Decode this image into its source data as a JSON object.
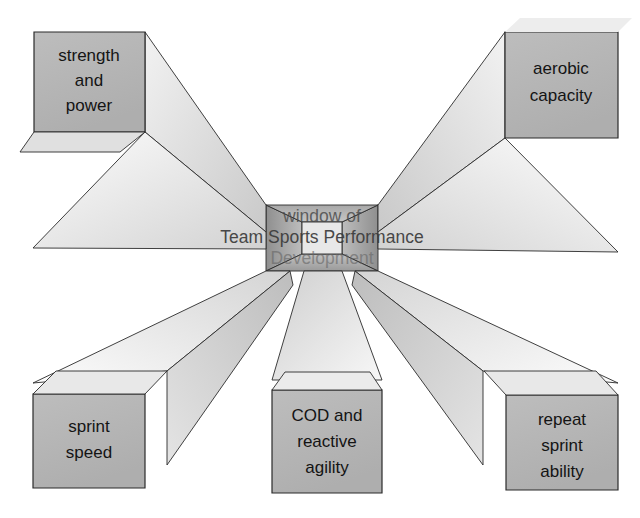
{
  "figure": {
    "title_center": {
      "line1": "window of",
      "line2": "Team Sports Performance",
      "line3": "Development"
    },
    "boxes": [
      {
        "id": "strength-and-power",
        "position": "top-left",
        "lines": [
          "strength",
          "and",
          "power"
        ]
      },
      {
        "id": "aerobic-capacity",
        "position": "top-right",
        "lines": [
          "aerobic",
          "capacity"
        ]
      },
      {
        "id": "sprint-speed",
        "position": "bottom-left",
        "lines": [
          "sprint",
          "speed"
        ]
      },
      {
        "id": "cod-and-reactive-agility",
        "position": "bottom-center",
        "lines": [
          "COD and",
          "reactive",
          "agility"
        ]
      },
      {
        "id": "repeat-sprint-ability",
        "position": "bottom-right",
        "lines": [
          "repeat",
          "sprint",
          "ability"
        ]
      }
    ],
    "colors": {
      "box_face": "#b8b8b8",
      "box_top_light": "#e6e6e6",
      "box_side_light": "#dcdcdc",
      "hub_dark": "#9c9c9c",
      "hub_center": "#c9c9c9",
      "outline": "#2b2b2b",
      "background": "#ffffff",
      "text": "#141414"
    }
  }
}
